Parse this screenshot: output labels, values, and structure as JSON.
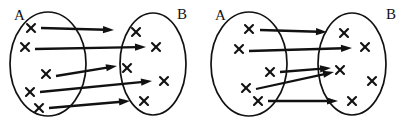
{
  "figure": {
    "background_color": "#ffffff",
    "ink_color": "#111111",
    "panel_count": 2
  },
  "panels": [
    {
      "id": "left-diagram",
      "name": "bijective-mapping",
      "description": "Each element of A maps to a distinct element of B",
      "set_a": {
        "label": "A",
        "label_x": 14,
        "label_y": 20,
        "ellipse": {
          "cx": 48,
          "cy": 64,
          "rx": 38,
          "ry": 52
        },
        "elements": [
          {
            "id": "a1",
            "glyph": "x",
            "x": 31,
            "y": 28
          },
          {
            "id": "a2",
            "glyph": "x",
            "x": 25,
            "y": 47
          },
          {
            "id": "a3",
            "glyph": "x",
            "x": 46,
            "y": 74
          },
          {
            "id": "a4",
            "glyph": "x",
            "x": 30,
            "y": 92
          },
          {
            "id": "a5",
            "glyph": "x",
            "x": 39,
            "y": 108
          }
        ]
      },
      "set_b": {
        "label": "B",
        "label_x": 177,
        "label_y": 19,
        "ellipse": {
          "cx": 153,
          "cy": 64,
          "rx": 33,
          "ry": 51
        },
        "elements": [
          {
            "id": "b1",
            "glyph": "x",
            "x": 136,
            "y": 32
          },
          {
            "id": "b2",
            "glyph": "x",
            "x": 156,
            "y": 47
          },
          {
            "id": "b3",
            "glyph": "x",
            "x": 127,
            "y": 68
          },
          {
            "id": "b4",
            "glyph": "x",
            "x": 164,
            "y": 81
          },
          {
            "id": "b5",
            "glyph": "x",
            "x": 144,
            "y": 101
          }
        ]
      },
      "arrows": [
        {
          "id": "m1",
          "from": "a1",
          "to": "b1",
          "x1": 41,
          "y1": 28,
          "x2": 114,
          "y2": 30
        },
        {
          "id": "m2",
          "from": "a2",
          "to": "b2",
          "x1": 35,
          "y1": 49,
          "x2": 146,
          "y2": 47
        },
        {
          "id": "m3",
          "from": "a3",
          "to": "b3",
          "x1": 56,
          "y1": 76,
          "x2": 117,
          "y2": 66
        },
        {
          "id": "m4",
          "from": "a4",
          "to": "b4",
          "x1": 40,
          "y1": 92,
          "x2": 152,
          "y2": 81
        },
        {
          "id": "m5",
          "from": "a5",
          "to": "b5",
          "x1": 49,
          "y1": 108,
          "x2": 130,
          "y2": 101
        }
      ]
    },
    {
      "id": "right-diagram",
      "name": "non-injective-mapping",
      "description": "Two elements of A map to the same element of B; one element of B unmapped",
      "set_a": {
        "label": "A",
        "label_x": 215,
        "label_y": 20,
        "ellipse": {
          "cx": 249,
          "cy": 64,
          "rx": 38,
          "ry": 52
        },
        "elements": [
          {
            "id": "a1",
            "glyph": "x",
            "x": 249,
            "y": 29
          },
          {
            "id": "a2",
            "glyph": "x",
            "x": 239,
            "y": 49
          },
          {
            "id": "a3",
            "glyph": "x",
            "x": 270,
            "y": 72
          },
          {
            "id": "a4",
            "glyph": "x",
            "x": 246,
            "y": 88
          },
          {
            "id": "a5",
            "glyph": "x",
            "x": 258,
            "y": 101
          }
        ]
      },
      "set_b": {
        "label": "B",
        "label_x": 386,
        "label_y": 19,
        "ellipse": {
          "cx": 352,
          "cy": 64,
          "rx": 34,
          "ry": 51
        },
        "elements": [
          {
            "id": "b1",
            "glyph": "x",
            "x": 344,
            "y": 33
          },
          {
            "id": "b2",
            "glyph": "x",
            "x": 365,
            "y": 47
          },
          {
            "id": "b3",
            "glyph": "x",
            "x": 340,
            "y": 70
          },
          {
            "id": "b4",
            "glyph": "x",
            "x": 372,
            "y": 81
          },
          {
            "id": "b5",
            "glyph": "x",
            "x": 352,
            "y": 101
          }
        ]
      },
      "arrows": [
        {
          "id": "m1",
          "from": "a1",
          "to": "b1",
          "x1": 260,
          "y1": 30,
          "x2": 327,
          "y2": 32
        },
        {
          "id": "m2",
          "from": "a2",
          "to": "b2",
          "x1": 249,
          "y1": 51,
          "x2": 352,
          "y2": 48
        },
        {
          "id": "m3",
          "from": "a3",
          "to": "b3",
          "x1": 280,
          "y1": 72,
          "x2": 331,
          "y2": 68
        },
        {
          "id": "m4",
          "from": "a4",
          "to": "b3",
          "x1": 256,
          "y1": 89,
          "x2": 334,
          "y2": 72
        },
        {
          "id": "m5",
          "from": "a5",
          "to": "b5",
          "x1": 268,
          "y1": 101,
          "x2": 338,
          "y2": 101
        }
      ]
    }
  ]
}
